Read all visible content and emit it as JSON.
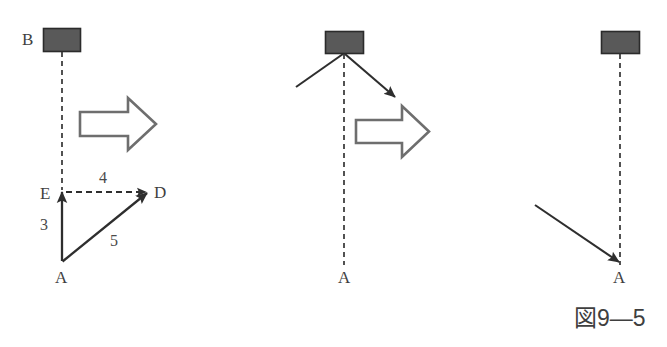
{
  "figure": {
    "caption": "図9—5",
    "background_color": "#ffffff",
    "ink_color": "#3f3f3f",
    "block_color": "#565656",
    "panels": [
      {
        "name": "left-panel",
        "block_label": "B",
        "vertex_labels": [
          "E",
          "D",
          "A"
        ],
        "edge_labels": [
          "3",
          "4",
          "5"
        ],
        "block_arrow": "right-block-arrow"
      },
      {
        "name": "middle-panel",
        "block_label": "",
        "vertex_labels": [
          "A"
        ],
        "edge_labels": [],
        "block_arrow": "right-block-arrow"
      },
      {
        "name": "right-panel",
        "block_label": "",
        "vertex_labels": [
          "A"
        ],
        "edge_labels": [],
        "block_arrow": ""
      }
    ]
  },
  "labels": {
    "left": {
      "b": "B",
      "e": "E",
      "d": "D",
      "a": "A",
      "side_3": "3",
      "side_4": "4",
      "side_5": "5"
    },
    "middle": {
      "a": "A"
    },
    "right": {
      "a": "A"
    }
  },
  "caption": {
    "text": "図9—5"
  }
}
